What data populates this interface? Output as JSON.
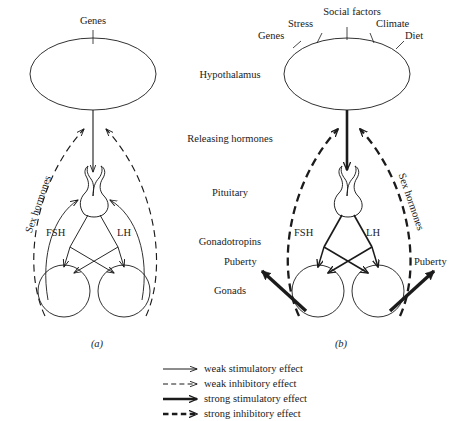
{
  "figure": {
    "title": "",
    "background_color": "#ffffff",
    "ink_color": "#1b1b1b"
  },
  "center_column": {
    "labels": [
      {
        "text": "Hypothalamus",
        "x": 230,
        "y": 76
      },
      {
        "text": "Releasing hormones",
        "x": 230,
        "y": 140
      },
      {
        "text": "Pituitary",
        "x": 230,
        "y": 194
      },
      {
        "text": "Gonadotropins",
        "x": 230,
        "y": 243
      },
      {
        "text": "Gonads",
        "x": 230,
        "y": 292
      }
    ]
  },
  "panels": [
    {
      "id": "a",
      "tag": "(a)",
      "tag_x": 97,
      "tag_y": 345,
      "inputs": [
        {
          "text": "Genes",
          "x": 93,
          "y": 16,
          "tick_x": 93
        }
      ],
      "hormone_labels": [
        {
          "text": "FSH",
          "x": 58,
          "y": 233
        },
        {
          "text": "LH",
          "x": 124,
          "y": 233
        }
      ],
      "feedback_label": {
        "text": "Sex hormones",
        "x": 30,
        "y": 228
      },
      "puberty_labels": []
    },
    {
      "id": "b",
      "tag": "(b)",
      "tag_x": 341,
      "tag_y": 345,
      "inputs": [
        {
          "text": "Genes",
          "x": 275,
          "y": 36,
          "tick_x": 300
        },
        {
          "text": "Stress",
          "x": 303,
          "y": 24,
          "tick_x": 319
        },
        {
          "text": "Social factors",
          "x": 352,
          "y": 12,
          "tick_x": 347
        },
        {
          "text": "Climate",
          "x": 392,
          "y": 24,
          "tick_x": 375
        },
        {
          "text": "Diet",
          "x": 414,
          "y": 36,
          "tick_x": 394
        }
      ],
      "hormone_labels": [
        {
          "text": "FSH",
          "x": 306,
          "y": 233
        },
        {
          "text": "LH",
          "x": 372,
          "y": 233
        }
      ],
      "feedback_label": {
        "text": "Sex hormones",
        "x": 398,
        "y": 180
      },
      "puberty_labels": [
        {
          "text": "Puberty",
          "x": 245,
          "y": 263
        },
        {
          "text": "Puberty",
          "x": 434,
          "y": 263
        }
      ]
    }
  ],
  "legend": {
    "x": 160,
    "y": 366,
    "row_height": 15,
    "items": [
      {
        "label": "weak stimulatory effect",
        "style": "thin-solid",
        "weight": 1.0,
        "dashed": false
      },
      {
        "label": "weak inhibitory effect",
        "style": "thin-dashed",
        "weight": 1.0,
        "dashed": true
      },
      {
        "label": "strong stimulatory effect",
        "style": "thick-solid",
        "weight": 2.4,
        "dashed": false
      },
      {
        "label": "strong inhibitory effect",
        "style": "thick-dashed",
        "weight": 2.4,
        "dashed": true
      }
    ]
  },
  "diagram_semantics": {
    "type": "diagram",
    "subject": "Hypothalamic-pituitary-gonadal axis regulation of puberty",
    "panel_a_meaning": "prepubertal state: weak stimulatory drive, strong inhibitory sex-hormone feedback",
    "panel_b_meaning": "pubertal state: strong stimulatory drive from multiple inputs, weak inhibitory feedback, puberty output"
  }
}
